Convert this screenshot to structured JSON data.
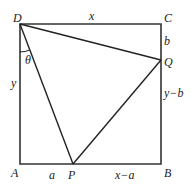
{
  "diagram": {
    "points": {
      "D": {
        "label": "D",
        "x": 20,
        "y": 24
      },
      "C": {
        "label": "C",
        "x": 161,
        "y": 24
      },
      "B": {
        "label": "B",
        "x": 161,
        "y": 164
      },
      "A": {
        "label": "A",
        "x": 20,
        "y": 164
      },
      "P": {
        "label": "P",
        "x": 73,
        "y": 164
      },
      "Q": {
        "label": "Q",
        "x": 161,
        "y": 60
      }
    },
    "segment_labels": {
      "top": "x",
      "left": "y",
      "right_upper": "b",
      "right_lower": "y−b",
      "bottom_left": "a",
      "bottom_right": "x−a"
    },
    "angle_label": "θ",
    "stroke_color": "#333333"
  }
}
